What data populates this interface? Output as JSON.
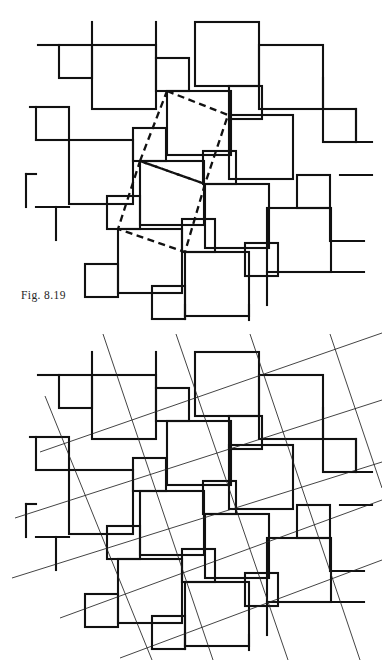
{
  "page": {
    "kind": "textbook-figure-plate",
    "background": "#ffffff",
    "width": 382,
    "height": 660,
    "ink_color": "#111111",
    "thin_line_color": "#222222"
  },
  "figures": [
    {
      "id": "fig-819",
      "caption": "Fig. 8.19",
      "caption_position": {
        "x": 21,
        "y": 289
      },
      "description": "Pinwheel tiling of two square sizes with a dashed lattice parallelogram overlay",
      "overlay_style": "dashed",
      "overlay_color": "#111111",
      "overlay_dash": "7 4.5",
      "overlay_width": 2.3,
      "overlay_polylines": [
        [
          [
            167,
            91
          ],
          [
            228,
            115
          ],
          [
            205,
            184
          ],
          [
            140,
            161
          ],
          [
            167,
            91
          ]
        ],
        [
          [
            140,
            161
          ],
          [
            205,
            184
          ],
          [
            185,
            252
          ],
          [
            118,
            229
          ],
          [
            140,
            161
          ]
        ]
      ]
    },
    {
      "id": "fig-820",
      "caption": "Fig. 8.20",
      "caption_position": {
        "x": 21,
        "y": 609
      },
      "description": "The same pinwheel tiling with two families of thin straight lattice lines drawn through matching tile corners",
      "overlay_style": "thin-lines",
      "overlay_color": "#222222",
      "overlay_width": 0.85,
      "overlay_line_families": [
        {
          "name": "steep",
          "angle_deg": 72,
          "count": 5
        },
        {
          "name": "shallow",
          "angle_deg": 20,
          "count": 5
        }
      ],
      "overlay_segments": [
        [
          [
            103,
            334
          ],
          [
            213,
            660
          ]
        ],
        [
          [
            176,
            334
          ],
          [
            288,
            660
          ]
        ],
        [
          [
            250,
            334
          ],
          [
            360,
            660
          ]
        ],
        [
          [
            45,
            396
          ],
          [
            152,
            660
          ]
        ],
        [
          [
            330,
            334
          ],
          [
            382,
            488
          ]
        ],
        [
          [
            40,
            452
          ],
          [
            382,
            333
          ]
        ],
        [
          [
            15,
            518
          ],
          [
            382,
            400
          ]
        ],
        [
          [
            12,
            578
          ],
          [
            382,
            462
          ]
        ],
        [
          [
            60,
            618
          ],
          [
            382,
            500
          ]
        ],
        [
          [
            120,
            658
          ],
          [
            382,
            560
          ]
        ]
      ]
    }
  ],
  "tiling": {
    "name": "pinwheel two-square tiling",
    "large_square_side": 64,
    "small_square_side": 33,
    "stroke_width": 2.1,
    "squares": [
      {
        "x": 92,
        "y": 45,
        "size": 64,
        "class": "large"
      },
      {
        "x": 195,
        "y": 22,
        "size": 64,
        "class": "large"
      },
      {
        "x": 259,
        "y": 45,
        "size": 64,
        "class": "large"
      },
      {
        "x": 69,
        "y": 140,
        "size": 64,
        "class": "large"
      },
      {
        "x": 167,
        "y": 91,
        "size": 64,
        "class": "large"
      },
      {
        "x": 229,
        "y": 115,
        "size": 64,
        "class": "large"
      },
      {
        "x": 140,
        "y": 161,
        "size": 64,
        "class": "large"
      },
      {
        "x": 205,
        "y": 184,
        "size": 64,
        "class": "large"
      },
      {
        "x": 267,
        "y": 208,
        "size": 64,
        "class": "large"
      },
      {
        "x": 118,
        "y": 229,
        "size": 64,
        "class": "large"
      },
      {
        "x": 185,
        "y": 252,
        "size": 64,
        "class": "large"
      },
      {
        "x": 59,
        "y": 45,
        "size": 33,
        "class": "small"
      },
      {
        "x": 156,
        "y": 58,
        "size": 33,
        "class": "small"
      },
      {
        "x": 229,
        "y": 86,
        "size": 33,
        "class": "small"
      },
      {
        "x": 36,
        "y": 107,
        "size": 33,
        "class": "small"
      },
      {
        "x": 133,
        "y": 128,
        "size": 33,
        "class": "small"
      },
      {
        "x": 323,
        "y": 109,
        "size": 33,
        "class": "small"
      },
      {
        "x": 203,
        "y": 151,
        "size": 33,
        "class": "small"
      },
      {
        "x": 297,
        "y": 175,
        "size": 33,
        "class": "small"
      },
      {
        "x": 107,
        "y": 196,
        "size": 33,
        "class": "small"
      },
      {
        "x": 182,
        "y": 219,
        "size": 33,
        "class": "small"
      },
      {
        "x": 245,
        "y": 243,
        "size": 33,
        "class": "small"
      },
      {
        "x": 85,
        "y": 264,
        "size": 33,
        "class": "small"
      },
      {
        "x": 152,
        "y": 286,
        "size": 33,
        "class": "small"
      }
    ]
  }
}
